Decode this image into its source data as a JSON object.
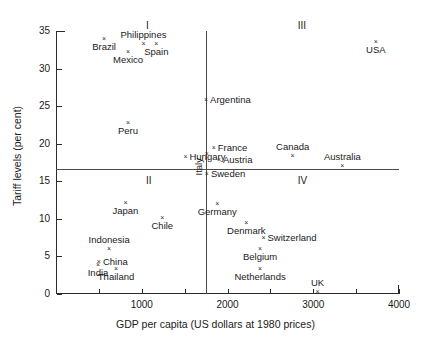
{
  "chart_data": {
    "type": "scatter",
    "title": "",
    "xlabel": "GDP per capita (US dollars at 1980 prices)",
    "ylabel": "Tariff levels (per cent)",
    "xlim": [
      0,
      4000
    ],
    "ylim": [
      0,
      35
    ],
    "grid": false,
    "legend": null,
    "xticks": [
      1000,
      2000,
      3000,
      4000
    ],
    "xminorticks": [
      500,
      1500,
      2500,
      3500
    ],
    "yticks": [
      0,
      5,
      10,
      15,
      20,
      25,
      30,
      35
    ],
    "dividers": {
      "x": 1750,
      "y": 16.6
    },
    "annotations": [
      {
        "text": "I",
        "x": 1120,
        "y": 35.7
      },
      {
        "text": "II",
        "x": 1120,
        "y": 15.0
      },
      {
        "text": "III",
        "x": 2890,
        "y": 35.7
      },
      {
        "text": "IV",
        "x": 2890,
        "y": 15.0
      }
    ],
    "points": [
      {
        "label": "Brazil",
        "x": 560,
        "y": 34.0,
        "label_pos": "below-c"
      },
      {
        "label": "Philippines",
        "x": 1020,
        "y": 33.3,
        "label_pos": "above-c"
      },
      {
        "label": "Spain",
        "x": 1170,
        "y": 33.3,
        "label_pos": "below-c"
      },
      {
        "label": "Mexico",
        "x": 840,
        "y": 32.2,
        "label_pos": "below-c"
      },
      {
        "label": "USA",
        "x": 3730,
        "y": 33.6,
        "label_pos": "below-c"
      },
      {
        "label": "Argentina",
        "x": 1750,
        "y": 25.8,
        "label_pos": "right"
      },
      {
        "label": "Peru",
        "x": 840,
        "y": 22.8,
        "label_pos": "below-c"
      },
      {
        "label": "Hungary",
        "x": 1510,
        "y": 18.2,
        "label_pos": "right"
      },
      {
        "label": "Italy",
        "x": 1760,
        "y": 18.6,
        "label_pos": "vertical"
      },
      {
        "label": "France",
        "x": 1840,
        "y": 19.4,
        "label_pos": "right"
      },
      {
        "label": "Austria",
        "x": 1900,
        "y": 17.8,
        "label_pos": "right"
      },
      {
        "label": "Canada",
        "x": 2760,
        "y": 18.3,
        "label_pos": "above-c"
      },
      {
        "label": "Australia",
        "x": 3340,
        "y": 17.0,
        "label_pos": "above-c"
      },
      {
        "label": "Sweden",
        "x": 1760,
        "y": 16.0,
        "label_pos": "right"
      },
      {
        "label": "Japan",
        "x": 810,
        "y": 12.1,
        "label_pos": "below-c"
      },
      {
        "label": "Chile",
        "x": 1240,
        "y": 10.1,
        "label_pos": "below-c"
      },
      {
        "label": "Germany",
        "x": 1880,
        "y": 12.0,
        "label_pos": "below-c"
      },
      {
        "label": "Denmark",
        "x": 2220,
        "y": 9.4,
        "label_pos": "below-c"
      },
      {
        "label": "Switzerland",
        "x": 2420,
        "y": 7.4,
        "label_pos": "right"
      },
      {
        "label": "Indonesia",
        "x": 620,
        "y": 6.0,
        "label_pos": "above-c"
      },
      {
        "label": "Belgium",
        "x": 2380,
        "y": 6.0,
        "label_pos": "below-c"
      },
      {
        "label": "China",
        "x": 500,
        "y": 4.2,
        "label_pos": "right"
      },
      {
        "label": "India",
        "x": 490,
        "y": 3.9,
        "label_pos": "below-c"
      },
      {
        "label": "Thailand",
        "x": 700,
        "y": 3.3,
        "label_pos": "below-c"
      },
      {
        "label": "Netherlands",
        "x": 2380,
        "y": 3.3,
        "label_pos": "below-c"
      },
      {
        "label": "UK",
        "x": 3050,
        "y": 0.2,
        "label_pos": "above-c"
      }
    ]
  }
}
